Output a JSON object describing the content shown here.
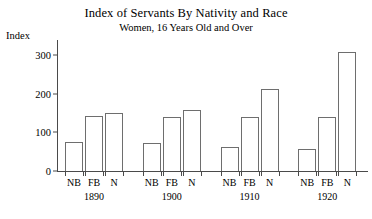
{
  "chart_data": {
    "type": "bar",
    "title": "Index of Servants By Nativity and Race",
    "subtitle": "Women, 16 Years Old and Over",
    "ylabel": "Index",
    "xlabel": "",
    "ylim": [
      0,
      340
    ],
    "yticks": [
      0,
      100,
      200,
      300
    ],
    "ytick_labels": [
      "0",
      "100",
      "200",
      "300"
    ],
    "grid": false,
    "legend": "none",
    "categories": [
      "1890",
      "1900",
      "1910",
      "1920"
    ],
    "subcategories": [
      "NB",
      "FB",
      "N"
    ],
    "series": [
      {
        "name": "NB",
        "values": [
          75,
          72,
          63,
          57
        ]
      },
      {
        "name": "FB",
        "values": [
          143,
          140,
          139,
          140
        ]
      },
      {
        "name": "N",
        "values": [
          150,
          158,
          213,
          309
        ]
      }
    ],
    "bars": [
      {
        "group": "1890",
        "sub": "NB",
        "value": 75
      },
      {
        "group": "1890",
        "sub": "FB",
        "value": 143
      },
      {
        "group": "1890",
        "sub": "N",
        "value": 150
      },
      {
        "group": "1900",
        "sub": "NB",
        "value": 72
      },
      {
        "group": "1900",
        "sub": "FB",
        "value": 140
      },
      {
        "group": "1900",
        "sub": "N",
        "value": 158
      },
      {
        "group": "1910",
        "sub": "NB",
        "value": 63
      },
      {
        "group": "1910",
        "sub": "FB",
        "value": 139
      },
      {
        "group": "1910",
        "sub": "N",
        "value": 213
      },
      {
        "group": "1920",
        "sub": "NB",
        "value": 57
      },
      {
        "group": "1920",
        "sub": "FB",
        "value": 140
      },
      {
        "group": "1920",
        "sub": "N",
        "value": 309
      }
    ],
    "colors": {
      "bar_fill": "#ffffff",
      "bar_stroke": "#6e6e6e",
      "axis": "#4a4a4a",
      "text": "#000000",
      "background": "#ffffff"
    }
  }
}
